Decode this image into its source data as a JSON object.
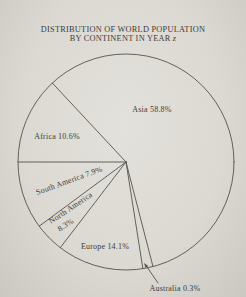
{
  "page": {
    "title": {
      "line1": "DISTRIBUTION OF WORLD POPULATION",
      "line2_prefix": "BY CONTINENT IN YEAR",
      "line2_variable": "z"
    }
  },
  "chart_data": {
    "type": "pie",
    "title": "DISTRIBUTION OF WORLD POPULATION BY CONTINENT IN YEAR z",
    "unit": "percent",
    "legend": "none",
    "labels_on_chart": true,
    "slices": [
      {
        "label": "Asia",
        "value": 58.8
      },
      {
        "label": "Africa",
        "value": 10.6
      },
      {
        "label": "South America",
        "value": 7.9
      },
      {
        "label": "North America",
        "value": 8.3
      },
      {
        "label": "Europe",
        "value": 14.1
      },
      {
        "label": "Australia",
        "value": 0.3
      }
    ],
    "layout": {
      "center": [
        126,
        162
      ],
      "radius": 108,
      "boundary_angles_deg": [
        133,
        180,
        216.5,
        232.5,
        279,
        284.5
      ],
      "slice_order_ccw_between_boundaries": [
        "Africa",
        "South America",
        "North America",
        "Europe",
        "Australia",
        "Asia"
      ]
    }
  },
  "labels": {
    "asia": "Asia 58.8%",
    "africa": "Africa 10.6%",
    "south_america": "South America 7.9%",
    "north_america_line1": "North America",
    "north_america_line2": "8.3%",
    "europe": "Europe 14.1%",
    "australia": "Australia 0.3%"
  },
  "colors": {
    "background": "#dcd9d3",
    "line": "#55524c",
    "text": "#3e3b36"
  }
}
